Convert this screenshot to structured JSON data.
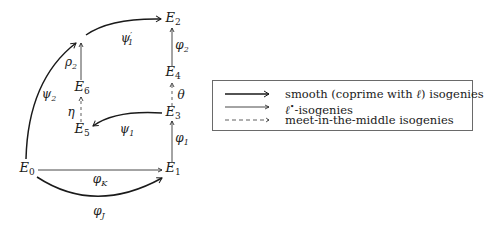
{
  "diagram": {
    "nodes": {
      "E0": {
        "base": "E",
        "sub": "0"
      },
      "E1": {
        "base": "E",
        "sub": "1"
      },
      "E2": {
        "base": "E",
        "sub": "2"
      },
      "E3": {
        "base": "E",
        "sub": "3"
      },
      "E4": {
        "base": "E",
        "sub": "4"
      },
      "E5": {
        "base": "E",
        "sub": "5"
      },
      "E6": {
        "base": "E",
        "sub": "6"
      }
    },
    "edges": {
      "phi_K": {
        "base": "φ",
        "sub": "K",
        "from": "E0",
        "to": "E1",
        "style": "thin"
      },
      "phi_J": {
        "base": "φ",
        "sub": "J",
        "from": "E0",
        "to": "E1",
        "style": "thick-curved"
      },
      "phi_1": {
        "base": "φ",
        "sub": "1",
        "from": "E1",
        "to": "E3",
        "style": "thin"
      },
      "theta": {
        "base": "θ",
        "sub": "",
        "from": "E3",
        "to": "E4",
        "style": "dashed"
      },
      "phi_2": {
        "base": "φ",
        "sub": "2",
        "from": "E4",
        "to": "E2",
        "style": "thin"
      },
      "psi_1": {
        "base": "ψ",
        "sub": "1",
        "from": "E3",
        "to": "E5",
        "style": "thick-curved"
      },
      "eta": {
        "base": "η",
        "sub": "",
        "from": "E5",
        "to": "E6",
        "style": "dashed"
      },
      "rho_2": {
        "base": "ρ",
        "sub": "2",
        "from": "E6",
        "to": "junction",
        "style": "thin"
      },
      "psi_2": {
        "base": "ψ",
        "sub": "2",
        "from": "E0",
        "to": "junction",
        "style": "thick-curved"
      },
      "psi_1_prime": {
        "base": "ψ",
        "prime": "′",
        "sub": "1",
        "from": "junction",
        "to": "E2",
        "style": "thick-curved"
      }
    }
  },
  "legend": {
    "items": [
      {
        "style": "thick",
        "text_pre": "smooth (coprime with ",
        "text_math": "ℓ",
        "text_post": ") isogenies"
      },
      {
        "style": "thin",
        "text_math": "ℓ",
        "text_sup": "•",
        "text_post": "-isogenies"
      },
      {
        "style": "dashed",
        "text_post": "meet-in-the-middle isogenies"
      }
    ]
  },
  "colors": {
    "ink": "#1a1a1a",
    "frame": "#6a6a6a",
    "background": "#ffffff"
  }
}
